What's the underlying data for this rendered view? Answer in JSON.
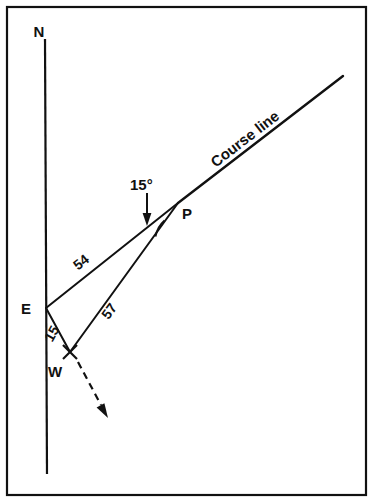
{
  "figure": {
    "background_color": "#ffffff",
    "ink_color": "#111111",
    "border": {
      "name": "figure-border",
      "x": 7,
      "y": 7,
      "width": 359,
      "height": 488,
      "stroke_width": 2.2
    }
  },
  "labels": {
    "north": "N",
    "east": "E",
    "west": "W",
    "point_p": "P",
    "course_line": "Course line",
    "angle": "15°",
    "distance_ep": "54",
    "distance_wp": "57",
    "distance_ew": "15"
  },
  "geometry": {
    "meridian": {
      "name": "north-south-meridian-line",
      "x1": 45,
      "y1": 40,
      "x2": 47,
      "y2": 473,
      "stroke_width": 2.2
    },
    "course_line_lower": {
      "name": "course-line-lower-segment",
      "x1": 46,
      "y1": 308,
      "x2": 178,
      "y2": 203,
      "stroke_width": 2.0
    },
    "course_line_upper": {
      "name": "course-line-upper-segment",
      "x1": 178,
      "y1": 203,
      "x2": 343,
      "y2": 76,
      "stroke_width": 2.4
    },
    "offset_line_wp": {
      "name": "offset-line-w-to-p",
      "x1": 70,
      "y1": 352,
      "x2": 178,
      "y2": 203,
      "stroke_width": 2.0
    },
    "offset_line_ew": {
      "name": "offset-line-e-to-w",
      "x1": 46,
      "y1": 308,
      "x2": 70,
      "y2": 352,
      "stroke_width": 2.0
    },
    "angle_arc": {
      "name": "angle-arc-at-p",
      "path": "M 155.5 236.5 A 28 28 0 0 1 164.5 220.5",
      "stroke_width": 1.8
    },
    "angle_pointer": {
      "name": "angle-callout-arrow",
      "x1": 147,
      "y1": 193,
      "x2": 147,
      "y2": 219,
      "stroke_width": 2.0,
      "head": "147,226 142.6,213 151.4,213"
    },
    "drift_arrow": {
      "name": "drift-direction-dashed-arrow",
      "x1": 78,
      "y1": 362,
      "x2": 101,
      "y2": 405,
      "stroke_width": 2.2,
      "dash": "7 5",
      "head": "108,418 96.6,407.5 104.4,403.3"
    },
    "w_marker": {
      "name": "w-cross-marker",
      "cx": 70,
      "cy": 352,
      "arm": 7
    }
  },
  "label_positions": {
    "north": {
      "x": 39,
      "y": 37,
      "size": 15,
      "rotate": 0
    },
    "east": {
      "x": 26,
      "y": 314,
      "size": 15,
      "rotate": 0
    },
    "west": {
      "x": 55,
      "y": 377,
      "size": 15,
      "rotate": 0
    },
    "point_p": {
      "x": 187,
      "y": 219,
      "size": 15,
      "rotate": 0
    },
    "course_line": {
      "x": 248,
      "y": 143,
      "size": 15,
      "rotate": -37.6
    },
    "angle": {
      "x": 130,
      "y": 190,
      "size": 15,
      "rotate": 0
    },
    "distance_ep": {
      "x": 84,
      "y": 266,
      "size": 14,
      "rotate": -38.5
    },
    "distance_wp": {
      "x": 113,
      "y": 314,
      "size": 14,
      "rotate": -54
    },
    "distance_ew": {
      "x": 56,
      "y": 336,
      "size": 14,
      "rotate": -61
    }
  }
}
